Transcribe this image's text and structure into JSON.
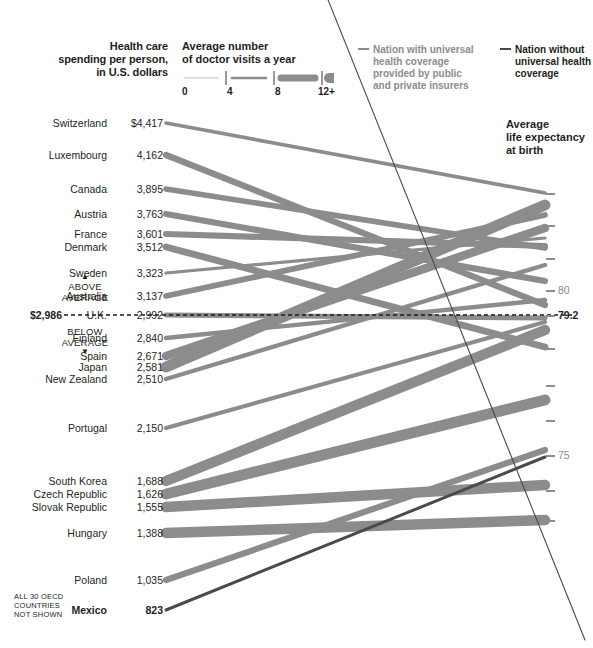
{
  "headers": {
    "spending": "Health care\nspending per person,\nin U.S. dollars",
    "spending_l1": "Health care",
    "spending_l2": "spending per person,",
    "spending_l3": "in U.S. dollars",
    "visits_l1": "Average number",
    "visits_l2": "of doctor visits a year",
    "life_l1": "Average",
    "life_l2": "life expectancy",
    "life_l3": "at birth"
  },
  "scale_legend": {
    "name": "doctor-visits-width-scale",
    "ticks": [
      "0",
      "4",
      "8",
      "12+"
    ]
  },
  "legend": {
    "universal": "Nation with universal health coverage provided by public and private insurers",
    "universal_l1": "Nation with universal",
    "universal_l2": "health coverage",
    "universal_l3": "provided by public",
    "universal_l4": "and private insurers",
    "none": "Nation without universal health coverage",
    "none_l1": "Nation without",
    "none_l2": "universal health",
    "none_l3": "coverage",
    "color_universal": "#8c8c8c",
    "color_none": "#4a4a4a"
  },
  "average": {
    "label": "$2,986",
    "above_l1": "ABOVE",
    "above_l2": "AVERAGE",
    "below_l1": "BELOW",
    "below_l2": "AVERAGE",
    "up_triangle": "▲",
    "down_triangle": "▼"
  },
  "footnote_l1": "ALL 30 OECD",
  "footnote_l2": "COUNTRIES",
  "footnote_l3": "NOT SHOWN",
  "axis_ticks": [
    {
      "y": 193,
      "label": ""
    },
    {
      "y": 225,
      "label": ""
    },
    {
      "y": 258,
      "label": ""
    },
    {
      "y": 290,
      "label": "80"
    },
    {
      "y": 315,
      "label": "79.2",
      "dark": true
    },
    {
      "y": 348,
      "label": ""
    },
    {
      "y": 385,
      "label": ""
    },
    {
      "y": 420,
      "label": ""
    },
    {
      "y": 455,
      "label": "75"
    },
    {
      "y": 490,
      "label": ""
    },
    {
      "y": 520,
      "label": ""
    }
  ],
  "chart_data": {
    "type": "line",
    "subtype": "slopegraph",
    "xlabel": "",
    "ylabel_left": "Health care spending per person, in U.S. dollars",
    "ylabel_right": "Average life expectancy at birth",
    "encoding": "line thickness = average number of doctor visits a year (0 to 12+)",
    "left_axis_average": 2986,
    "right_axis_reference": 79.2,
    "right_axis_labeled_ticks": [
      80,
      75
    ],
    "grid": false,
    "legend_position": "top-right",
    "series": [
      {
        "name": "Switzerland",
        "spending": 4417,
        "spending_label": "$4,417",
        "life_expectancy": 81.7,
        "visits": 3.4,
        "universal": true,
        "y_left": 123,
        "y_right": 193
      },
      {
        "name": "Luxembourg",
        "spending": 4162,
        "spending_label": "4,162",
        "life_expectancy": 79.4,
        "visits": 6.6,
        "universal": true,
        "y_left": 155,
        "y_right": 305
      },
      {
        "name": "Canada",
        "spending": 3895,
        "spending_label": "3,895",
        "life_expectancy": 80.7,
        "visits": 5.8,
        "universal": true,
        "y_left": 189,
        "y_right": 248
      },
      {
        "name": "Austria",
        "spending": 3763,
        "spending_label": "3,763",
        "life_expectancy": 79.9,
        "visits": 6.7,
        "universal": true,
        "y_left": 214,
        "y_right": 281
      },
      {
        "name": "France",
        "spending": 3601,
        "spending_label": "3,601",
        "life_expectancy": 80.7,
        "visits": 6.4,
        "universal": true,
        "y_left": 234,
        "y_right": 246
      },
      {
        "name": "Denmark",
        "spending": 3512,
        "spending_label": "3,512",
        "life_expectancy": 78.4,
        "visits": 7.5,
        "universal": true,
        "y_left": 247,
        "y_right": 347
      },
      {
        "name": "Sweden",
        "spending": 3323,
        "spending_label": "3,323",
        "life_expectancy": 80.9,
        "visits": 2.8,
        "universal": true,
        "y_left": 273,
        "y_right": 238
      },
      {
        "name": "Australia",
        "spending": 3137,
        "spending_label": "3,137",
        "life_expectancy": 81.4,
        "visits": 6.1,
        "universal": true,
        "y_left": 296,
        "y_right": 215
      },
      {
        "name": "U.K.",
        "spending": 2992,
        "spending_label": "2,992",
        "life_expectancy": 79.1,
        "visits": 5.1,
        "universal": true,
        "y_left": 315,
        "y_right": 318
      },
      {
        "name": "Finland",
        "spending": 2840,
        "spending_label": "2,840",
        "life_expectancy": 79.5,
        "visits": 4.2,
        "universal": true,
        "y_left": 338,
        "y_right": 300
      },
      {
        "name": "Spain",
        "spending": 2671,
        "spending_label": "2,671",
        "life_expectancy": 81.1,
        "visits": 9.5,
        "universal": true,
        "y_left": 356,
        "y_right": 228
      },
      {
        "name": "Japan",
        "spending": 2581,
        "spending_label": "2,581",
        "life_expectancy": 82.6,
        "visits": 13.6,
        "universal": true,
        "y_left": 367,
        "y_right": 205
      },
      {
        "name": "New Zealand",
        "spending": 2510,
        "spending_label": "2,510",
        "life_expectancy": 80.2,
        "visits": 4.3,
        "universal": true,
        "y_left": 379,
        "y_right": 265
      },
      {
        "name": "Portugal",
        "spending": 2150,
        "spending_label": "2,150",
        "life_expectancy": 79.1,
        "visits": 4.0,
        "universal": true,
        "y_left": 428,
        "y_right": 322
      },
      {
        "name": "South Korea",
        "spending": 1688,
        "spending_label": "1,688",
        "life_expectancy": 79.1,
        "visits": 11.8,
        "universal": true,
        "y_left": 481,
        "y_right": 330
      },
      {
        "name": "Czech Republic",
        "spending": 1626,
        "spending_label": "1,626",
        "life_expectancy": 77.0,
        "visits": 13.0,
        "universal": true,
        "y_left": 494,
        "y_right": 400
      },
      {
        "name": "Slovak Republic",
        "spending": 1555,
        "spending_label": "1,555",
        "life_expectancy": 74.3,
        "visits": 12.0,
        "universal": true,
        "y_left": 507,
        "y_right": 485
      },
      {
        "name": "Hungary",
        "spending": 1388,
        "spending_label": "1,388",
        "life_expectancy": 73.3,
        "visits": 12.0,
        "universal": true,
        "y_left": 533,
        "y_right": 520
      },
      {
        "name": "Poland",
        "spending": 1035,
        "spending_label": "1,035",
        "life_expectancy": 75.3,
        "visits": 6.5,
        "universal": true,
        "y_left": 580,
        "y_right": 450
      },
      {
        "name": "Mexico",
        "spending": 823,
        "spending_label": "823",
        "life_expectancy": 75.0,
        "visits": 2.5,
        "universal": false,
        "y_left": 610,
        "y_right": 457
      },
      {
        "name": "United States",
        "spending": 7290,
        "spending_label": "",
        "life_expectancy": 78.1,
        "visits": 3.8,
        "universal": false,
        "y_left": -70,
        "y_right": 640,
        "offscreen": true
      }
    ]
  }
}
